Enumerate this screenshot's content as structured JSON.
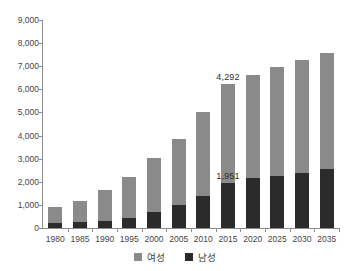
{
  "header": {
    "fragment_left": " ",
    "fragment_right": " "
  },
  "legend": {
    "female_label": "여성",
    "male_label": "남성",
    "female_swatch_name": "legend-swatch-female",
    "male_swatch_name": "legend-swatch-male"
  },
  "colors": {
    "female": "#8a8a8a",
    "male": "#2b2b2b",
    "axis": "#8d8d8d",
    "text": "#454545",
    "background": "#ffffff"
  },
  "chart_data": {
    "type": "bar",
    "stacked": true,
    "title": "",
    "subtitle": "",
    "xlabel": "",
    "ylabel": "",
    "ylim": [
      0,
      9000
    ],
    "ytick_step": 1000,
    "grid": false,
    "legend_position": "bottom-center",
    "categories": [
      "1980",
      "1985",
      "1990",
      "1995",
      "2000",
      "2005",
      "2010",
      "2015",
      "2020",
      "2025",
      "2030",
      "2035"
    ],
    "ytick_labels": [
      "0",
      "1,000",
      "2,000",
      "3,000",
      "4,000",
      "5,000",
      "6,000",
      "7,000",
      "8,000",
      "9,000"
    ],
    "ytick_values": [
      0,
      1000,
      2000,
      3000,
      4000,
      5000,
      6000,
      7000,
      8000,
      9000
    ],
    "series": [
      {
        "name": "남성",
        "key": "male",
        "color": "#2b2b2b",
        "values": [
          200,
          250,
          290,
          450,
          700,
          1000,
          1370,
          1951,
          2150,
          2240,
          2360,
          2570
        ]
      },
      {
        "name": "여성",
        "key": "female",
        "color": "#8a8a8a",
        "values": [
          720,
          940,
          1340,
          1740,
          2330,
          2870,
          3630,
          4292,
          4480,
          4710,
          4890,
          5020
        ]
      }
    ],
    "totals": [
      920,
      1190,
      1630,
      2190,
      3030,
      3870,
      5000,
      6243,
      6630,
      6950,
      7250,
      7590
    ],
    "annotations": [
      {
        "text": "4,292",
        "category": "2015",
        "series": "여성",
        "value": 4292
      },
      {
        "text": "1,951",
        "category": "2015",
        "series": "남성",
        "value": 1951
      }
    ]
  }
}
